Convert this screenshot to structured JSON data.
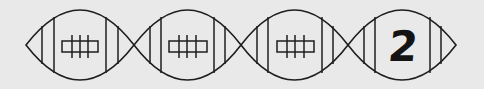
{
  "puzzle": {
    "footballs": [
      {
        "index": 0,
        "content": "laces",
        "label": ""
      },
      {
        "index": 1,
        "content": "laces",
        "label": ""
      },
      {
        "index": 2,
        "content": "laces",
        "label": ""
      },
      {
        "index": 3,
        "content": "number",
        "label": "2"
      }
    ]
  },
  "colors": {
    "background": "#e9e9e9",
    "line": "#1e1e1e",
    "number": "#141414"
  }
}
